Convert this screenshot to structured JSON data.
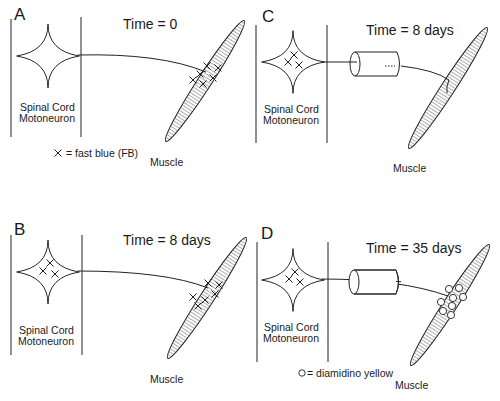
{
  "figure": {
    "panels": [
      {
        "id": "A",
        "letter": "A",
        "time_label": "Time = 0",
        "cell_label_line1": "Spinal Cord",
        "cell_label_line2": "Motoneuron",
        "target_label": "Muscle",
        "legend": "= fast blue (FB)",
        "legend_symbol": "×",
        "conduit": false,
        "soma_markers": "none",
        "muscle_markers": "fast-blue-crosses"
      },
      {
        "id": "B",
        "letter": "B",
        "time_label": "Time = 8 days",
        "cell_label_line1": "Spinal Cord",
        "cell_label_line2": "Motoneuron",
        "target_label": "Muscle",
        "conduit": false,
        "soma_markers": "fast-blue-crosses",
        "muscle_markers": "fast-blue-crosses"
      },
      {
        "id": "C",
        "letter": "C",
        "time_label": "Time = 8 days",
        "cell_label_line1": "Spinal Cord",
        "cell_label_line2": "Motoneuron",
        "target_label": "Muscle",
        "conduit": true,
        "soma_markers": "fast-blue-crosses",
        "muscle_markers": "none"
      },
      {
        "id": "D",
        "letter": "D",
        "time_label": "Time = 35 days",
        "cell_label_line1": "Spinal Cord",
        "cell_label_line2": "Motoneuron",
        "target_label": "Muscle",
        "legend": "= diamidino yellow",
        "legend_symbol": "○",
        "conduit": true,
        "soma_markers": "fast-blue-crosses",
        "muscle_markers": "diamidino-yellow-circles"
      }
    ],
    "colors": {
      "line": "#222222",
      "background": "#ffffff"
    }
  }
}
